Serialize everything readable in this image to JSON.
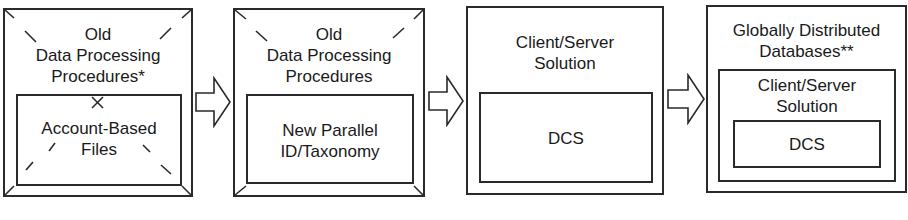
{
  "diagram": {
    "stages": [
      {
        "outer_label": "Old\nData Processing\nProcedures*",
        "inner_label": "Account-Based\nFiles",
        "crossed_out": true
      },
      {
        "outer_label": "Old\nData Processing\nProcedures",
        "inner_label": "New Parallel\nID/Taxonomy",
        "crossed_out": false
      },
      {
        "outer_label": "Client/Server\nSolution",
        "inner_label": "DCS"
      },
      {
        "outer_label": "Globally Distributed\nDatabases**",
        "middle_label": "Client/Server\nSolution",
        "inner_label": "DCS"
      }
    ],
    "arrows": [
      "right-arrow",
      "right-arrow",
      "right-arrow"
    ],
    "colors": {
      "stroke": "#2a2a2a",
      "background": "#ffffff",
      "text": "#1a1a1a"
    }
  }
}
